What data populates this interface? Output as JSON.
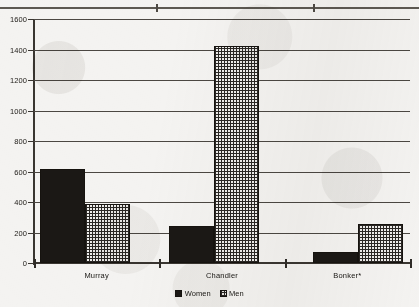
{
  "chart_data": {
    "type": "bar",
    "title": "",
    "xlabel": "",
    "ylabel": "",
    "ylim": [
      0,
      1600
    ],
    "ytick_step": 200,
    "yticks": [
      0,
      200,
      400,
      600,
      800,
      1000,
      1200,
      1400,
      1600
    ],
    "ytick_labels": [
      "0",
      "200",
      "400",
      "600",
      "800",
      "1000",
      "1200",
      "1400",
      "1600"
    ],
    "grid": true,
    "legend_position": "bottom-center",
    "categories": [
      "Murray",
      "Chandler",
      "Bonker*"
    ],
    "series": [
      {
        "name": "Women",
        "pattern": "solid-black",
        "color": "#1b1815",
        "values": [
          615,
          240,
          70
        ]
      },
      {
        "name": "Men",
        "pattern": "cross-hatch-grid",
        "color": "#efeeec",
        "values": [
          385,
          1425,
          255
        ]
      }
    ]
  },
  "legend": {
    "items": [
      {
        "label": "Women",
        "swatch": "solid-swatch-icon"
      },
      {
        "label": "Men",
        "swatch": "hatched-swatch-icon"
      }
    ]
  },
  "page": {
    "top_rule": "cut-off-horizontal-rule"
  }
}
